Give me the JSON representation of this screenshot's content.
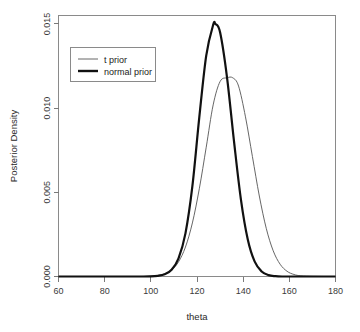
{
  "chart_data": {
    "type": "line",
    "title": "",
    "xlabel": "theta",
    "ylabel": "Posterior Density",
    "xlim": [
      60,
      180
    ],
    "ylim": [
      0.0,
      0.0155
    ],
    "xticks": [
      60,
      80,
      100,
      120,
      140,
      160,
      180
    ],
    "xtick_labels": [
      "60",
      "80",
      "100",
      "120",
      "140",
      "160",
      "180"
    ],
    "yticks": [
      0.0,
      0.005,
      0.01,
      0.015
    ],
    "ytick_labels": [
      "0.000",
      "0.005",
      "0.010",
      "0.015"
    ],
    "grid": false,
    "legend_position": "upper-left",
    "series": [
      {
        "name": "t prior",
        "style": "thin",
        "color": "#555555",
        "linewidth": 0.9,
        "peak_x": 135.5,
        "peak_y": 0.0118,
        "sigma": 6.8,
        "x": [
          60,
          65,
          70,
          75,
          80,
          85,
          90,
          95,
          100,
          103,
          106,
          109,
          112,
          115,
          118,
          121,
          124,
          127,
          130,
          133,
          135.5,
          138,
          141,
          144,
          147,
          150,
          153,
          156,
          159,
          162,
          165,
          170,
          175,
          180
        ],
        "y": [
          0.0,
          0.0,
          0.0,
          0.0,
          0.0,
          0.0,
          0.0,
          0.0,
          2e-05,
          6e-05,
          0.00016,
          0.00039,
          0.00087,
          0.00175,
          0.00318,
          0.00521,
          0.00768,
          0.01019,
          0.01158,
          0.0118,
          0.0118,
          0.01131,
          0.00948,
          0.00713,
          0.00478,
          0.00286,
          0.00153,
          0.00073,
          0.00031,
          0.00012,
          4e-05,
          1e-05,
          0.0,
          0.0
        ]
      },
      {
        "name": "normal prior",
        "style": "thick",
        "color": "#111111",
        "linewidth": 2.2,
        "peak_x": 128.0,
        "peak_y": 0.015,
        "sigma": 5.3,
        "x": [
          60,
          65,
          70,
          75,
          80,
          85,
          90,
          95,
          100,
          103,
          106,
          109,
          112,
          115,
          118,
          121,
          124,
          127,
          128,
          130,
          133,
          136,
          139,
          142,
          145,
          148,
          151,
          154,
          157,
          160,
          165,
          170,
          175,
          180
        ],
        "y": [
          0.0,
          0.0,
          0.0,
          0.0,
          0.0,
          0.0,
          0.0,
          0.0,
          1e-05,
          4e-05,
          0.00013,
          0.0004,
          0.00108,
          0.00256,
          0.00536,
          0.00946,
          0.01312,
          0.01494,
          0.015,
          0.0145,
          0.01183,
          0.00807,
          0.0046,
          0.0022,
          0.00088,
          0.0003,
          8e-05,
          2e-05,
          0.0,
          0.0,
          0.0,
          0.0,
          0.0,
          0.0
        ]
      }
    ],
    "legend": {
      "entries": [
        "t prior",
        "normal prior"
      ]
    }
  }
}
